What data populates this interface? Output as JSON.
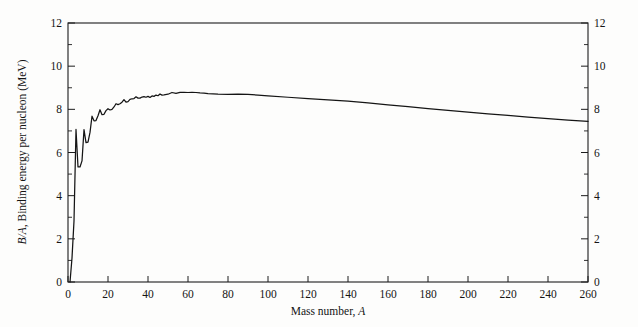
{
  "figure": {
    "background_color": "#fdfdfc",
    "ink_color": "#151515"
  },
  "chart_data": {
    "type": "line",
    "title": "",
    "xlabel": "Mass number, A",
    "xlabel_plain": "Mass number,",
    "xlabel_italic": "A",
    "ylabel": "B/A, Binding energy per nucleon (MeV)",
    "ylabel_italic_prefix": "B/A",
    "ylabel_rest": ", Binding energy per nucleon (MeV)",
    "ylabel_right": "",
    "xlim": [
      0,
      260
    ],
    "ylim": [
      0,
      12
    ],
    "xticks": [
      0,
      20,
      40,
      60,
      80,
      100,
      120,
      140,
      160,
      180,
      200,
      220,
      240,
      260
    ],
    "xtick_labels": [
      "0",
      "20",
      "40",
      "60",
      "80",
      "100",
      "120",
      "140",
      "160",
      "180",
      "200",
      "220",
      "240",
      "260"
    ],
    "yticks": [
      0,
      2,
      4,
      6,
      8,
      10,
      12
    ],
    "ytick_labels": [
      "0",
      "2",
      "4",
      "6",
      "8",
      "10",
      "12"
    ],
    "yticks_minor": [
      1,
      3,
      5,
      7,
      9,
      11
    ],
    "grid": false,
    "legend": null,
    "left_axis_labels": [
      "0",
      "2",
      "4",
      "6",
      "8",
      "10",
      "12"
    ],
    "right_axis_labels": [
      "0",
      "2",
      "4",
      "6",
      "8",
      "10",
      "12"
    ],
    "series": [
      {
        "name": "Binding energy per nucleon",
        "x": [
          1,
          2,
          3,
          4,
          5,
          6,
          7,
          8,
          9,
          10,
          11,
          12,
          13,
          14,
          15,
          16,
          17,
          18,
          19,
          20,
          21,
          22,
          23,
          24,
          25,
          26,
          27,
          28,
          29,
          30,
          31,
          32,
          33,
          34,
          35,
          36,
          37,
          38,
          39,
          40,
          41,
          42,
          43,
          44,
          45,
          46,
          47,
          48,
          50,
          52,
          54,
          56,
          58,
          60,
          62,
          64,
          66,
          68,
          70,
          75,
          80,
          85,
          90,
          95,
          100,
          110,
          120,
          130,
          140,
          150,
          160,
          170,
          180,
          190,
          200,
          210,
          220,
          230,
          240,
          250,
          260
        ],
        "y": [
          0.0,
          1.11,
          2.83,
          7.07,
          5.33,
          5.33,
          5.61,
          7.06,
          6.46,
          6.48,
          6.93,
          7.68,
          7.47,
          7.48,
          7.7,
          7.98,
          7.75,
          7.77,
          7.94,
          8.03,
          7.97,
          8.0,
          8.11,
          8.26,
          8.22,
          8.26,
          8.33,
          8.45,
          8.33,
          8.36,
          8.46,
          8.49,
          8.5,
          8.58,
          8.52,
          8.52,
          8.57,
          8.59,
          8.56,
          8.6,
          8.55,
          8.62,
          8.6,
          8.66,
          8.63,
          8.71,
          8.66,
          8.67,
          8.7,
          8.78,
          8.74,
          8.79,
          8.79,
          8.78,
          8.79,
          8.78,
          8.76,
          8.75,
          8.73,
          8.7,
          8.69,
          8.7,
          8.69,
          8.66,
          8.62,
          8.56,
          8.5,
          8.44,
          8.38,
          8.3,
          8.21,
          8.12,
          8.03,
          7.95,
          7.87,
          7.79,
          7.72,
          7.64,
          7.57,
          7.5,
          7.44
        ],
        "color": "#151515",
        "style": "solid"
      }
    ]
  }
}
